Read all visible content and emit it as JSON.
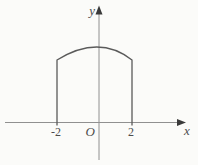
{
  "figure": {
    "labels": {
      "y_axis": "y",
      "x_axis": "x",
      "origin": "O",
      "tick_neg2": "-2",
      "tick_pos2": "2"
    },
    "colors": {
      "background": "#fbfbf9",
      "axis": "#909090",
      "arrowhead": "#3a3a3a",
      "curve": "#5a5a5a",
      "ink": "#4c4c4c"
    },
    "chart_data": {
      "type": "line",
      "title": "",
      "xlabel": "x",
      "ylabel": "y",
      "x_ticks": [
        -2,
        2
      ],
      "description_points": "closed region outline: vertical side at x=-2, vertical side at x=2, curved top arc peaking on the y-axis",
      "region": {
        "x_left": -2,
        "x_right": 2
      }
    },
    "geometry": {
      "x_axis": {
        "x1": 5,
        "x2": 178,
        "y": 122.5
      },
      "x_arrow": {
        "tip": 186,
        "back": 177,
        "half_width": 3.5
      },
      "y_axis": {
        "x": 99,
        "y1": 13,
        "y2": 160
      },
      "y_arrow": {
        "tip": 5.5,
        "back": 14.5,
        "half_width": 3.5
      },
      "shape": {
        "left_x": 57,
        "right_x": 132,
        "base_y": 125.5,
        "corner_y": 60,
        "ctrl_x": 99,
        "ctrl_y": 34
      }
    }
  }
}
